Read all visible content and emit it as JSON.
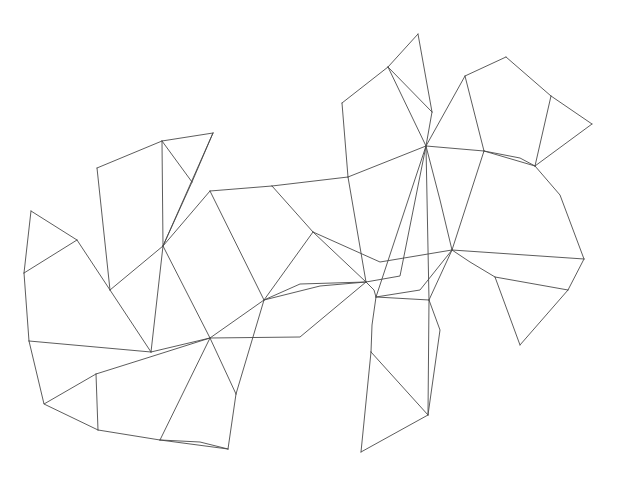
{
  "figure": {
    "background_color": "#ffffff",
    "stroke_color": "#4a4a4a",
    "stroke_width": 0.9,
    "canvas": {
      "width": 622,
      "height": 479
    },
    "cluster_labels": [
      "left-cluster",
      "right-cluster"
    ],
    "polygon_count": 22,
    "polygons": [
      {
        "id": "left-upper-quad",
        "name": "left upper quadrilateral",
        "sides": 4,
        "points": "97,168 162,141 163,246 110,290"
      },
      {
        "id": "left-top-triangle",
        "name": "left top triangle",
        "sides": 3,
        "points": "162,141 213,133 192,182"
      },
      {
        "id": "left-top-wedge",
        "name": "left top wedge triangle",
        "sides": 3,
        "points": "213,133 192,182 163,246"
      },
      {
        "id": "far-left-triangle",
        "name": "far left upper triangle",
        "sides": 3,
        "points": "31,211 77,240 24,273"
      },
      {
        "id": "far-left-quad",
        "name": "far left lower quadrilateral",
        "sides": 4,
        "points": "31,211 77,240 110,290 24,273"
      },
      {
        "id": "far-left-pent",
        "name": "far left pentagon",
        "sides": 5,
        "points": "24,273 110,290 163,286 151,352 29,341"
      },
      {
        "id": "left-mid-quad",
        "name": "left middle quadrilateral",
        "sides": 4,
        "points": "110,290 163,246 210,338 151,352"
      },
      {
        "id": "left-center-tri",
        "name": "left center triangle",
        "sides": 3,
        "points": "163,246 210,338 151,352"
      },
      {
        "id": "left-lower-pent",
        "name": "left lower pentagon",
        "sides": 5,
        "points": "29,341 151,352 210,338 216,340 160,440"
      },
      {
        "id": "bottom-left-tri",
        "name": "bottom left triangle",
        "sides": 3,
        "points": "44,404 96,374 98,430"
      },
      {
        "id": "bottom-left-quad",
        "name": "bottom left quadrilateral",
        "sides": 4,
        "points": "96,374 98,430 160,440 140,373"
      },
      {
        "id": "bottom-mid-quad",
        "name": "bottom middle quadrilateral",
        "sides": 4,
        "points": "210,338 236,394 228,449 160,440"
      },
      {
        "id": "bottom-mid-tri",
        "name": "bottom middle triangle",
        "sides": 3,
        "points": "210,338 264,300 236,394"
      },
      {
        "id": "center-quad",
        "name": "center quadrilateral",
        "sides": 4,
        "points": "163,246 210,191 264,300 210,338"
      },
      {
        "id": "center-lens-upper",
        "name": "center upper lens panel",
        "sides": 4,
        "points": "210,191 272,186 313,232 264,300"
      },
      {
        "id": "center-lens-lower",
        "name": "center lower lens panel",
        "sides": 4,
        "points": "264,300 313,232 366,282 280,281"
      },
      {
        "id": "center-right-quad",
        "name": "center right quadrilateral",
        "sides": 4,
        "points": "272,186 348,177 366,282 313,232"
      },
      {
        "id": "center-right-tri",
        "name": "center right triangle",
        "sides": 3,
        "points": "348,177 426,146 366,282"
      },
      {
        "id": "right-upper-quad",
        "name": "right upper quadrilateral",
        "sides": 4,
        "points": "342,103 388,67 426,146 348,177"
      },
      {
        "id": "right-top-tri",
        "name": "right top triangle",
        "sides": 3,
        "points": "388,67 418,34 432,112"
      },
      {
        "id": "right-top-wedge",
        "name": "right top wedge",
        "sides": 3,
        "points": "388,67 432,112 426,146"
      },
      {
        "id": "right-pent",
        "name": "right pentagon",
        "sides": 5,
        "points": "426,146 465,76 506,57 551,96 484,151"
      },
      {
        "id": "right-far-tri",
        "name": "right far triangle",
        "sides": 3,
        "points": "551,96 592,124 535,166"
      },
      {
        "id": "right-center-tri",
        "name": "right center triangle",
        "sides": 3,
        "points": "426,146 465,76 484,151"
      },
      {
        "id": "right-lower-pent",
        "name": "right lower pentagon",
        "sides": 5,
        "points": "484,151 535,166 592,124 584,259 452,250"
      },
      {
        "id": "right-lower-quad",
        "name": "right lower quadrilateral",
        "sides": 4,
        "points": "452,250 584,259 568,290 495,277"
      },
      {
        "id": "right-bottom-tri",
        "name": "right bottom triangle",
        "sides": 3,
        "points": "495,277 568,290 520,345"
      },
      {
        "id": "right-bottom-pent",
        "name": "right bottom pentagon",
        "sides": 5,
        "points": "426,146 484,151 452,250 429,300 376,297"
      },
      {
        "id": "bottom-right-quad",
        "name": "bottom right quadrilateral",
        "sides": 4,
        "points": "376,297 429,300 428,415 371,352"
      },
      {
        "id": "bottom-right-tri",
        "name": "bottom right triangle",
        "sides": 3,
        "points": "371,352 428,415 361,452"
      }
    ],
    "strokes": [
      {
        "id": "s01",
        "name": "left upper quad top edge",
        "d": "M 97,168 L 162,141"
      },
      {
        "id": "s02",
        "name": "left top triangle apex edge",
        "d": "M 162,141 L 213,133"
      },
      {
        "id": "s03",
        "name": "left top triangle right edge",
        "d": "M 213,133 L 192,182"
      },
      {
        "id": "s04",
        "name": "left top triangle base edge",
        "d": "M 192,182 L 162,141"
      },
      {
        "id": "s05",
        "name": "left top wedge long edge",
        "d": "M 213,133 L 163,246"
      },
      {
        "id": "s06",
        "name": "left top wedge inner edge",
        "d": "M 192,182 L 163,246"
      },
      {
        "id": "s07",
        "name": "left upper quad left edge",
        "d": "M 97,168 L 110,290"
      },
      {
        "id": "s08",
        "name": "left upper quad inner edge",
        "d": "M 162,141 L 163,246"
      },
      {
        "id": "s09",
        "name": "left upper quad bottom edge",
        "d": "M 110,290 L 163,246"
      },
      {
        "id": "s10",
        "name": "far left triangle top edge",
        "d": "M 31,211 L 77,240"
      },
      {
        "id": "s11",
        "name": "far left triangle left edge",
        "d": "M 31,211 L 24,273"
      },
      {
        "id": "s12",
        "name": "far left triangle base edge",
        "d": "M 77,240 L 24,273"
      },
      {
        "id": "s13",
        "name": "far left diagonal to hub",
        "d": "M 77,240 L 110,290"
      },
      {
        "id": "s14",
        "name": "far left pentagon left edge",
        "d": "M 24,273 L 29,341"
      },
      {
        "id": "s15",
        "name": "far left pentagon bottom edge",
        "d": "M 29,341 L 151,352"
      },
      {
        "id": "s16",
        "name": "far left pentagon inner edge",
        "d": "M 110,290 L 151,352"
      },
      {
        "id": "s17",
        "name": "left center hub to junction",
        "d": "M 163,246 L 210,338"
      },
      {
        "id": "s18",
        "name": "left center hub to lower vertex",
        "d": "M 163,246 L 151,352"
      },
      {
        "id": "s19",
        "name": "left lower pentagon top edge",
        "d": "M 151,352 L 210,338"
      },
      {
        "id": "s20",
        "name": "left lower pentagon right edge",
        "d": "M 210,338 L 160,440"
      },
      {
        "id": "s21",
        "name": "left lower pentagon bottom curve",
        "d": "M 29,341 L 44,404 L 96,374"
      },
      {
        "id": "s22",
        "name": "bottom left triangle left edge",
        "d": "M 44,404 L 98,430"
      },
      {
        "id": "s23",
        "name": "bottom left triangle inner edge",
        "d": "M 96,374 L 98,430"
      },
      {
        "id": "s24",
        "name": "bottom left quad bottom edge",
        "d": "M 98,430 L 160,440"
      },
      {
        "id": "s25",
        "name": "bottom left quad top curve",
        "d": "M 96,374 L 150,357 L 210,338"
      },
      {
        "id": "s26",
        "name": "bottom mid quad left edge",
        "d": "M 160,440 L 228,449"
      },
      {
        "id": "s27",
        "name": "bottom mid quad right edge",
        "d": "M 228,449 L 236,394"
      },
      {
        "id": "s28",
        "name": "bottom mid triangle right edge",
        "d": "M 236,394 L 264,300"
      },
      {
        "id": "s29",
        "name": "bottom mid triangle left edge",
        "d": "M 236,394 L 210,338"
      },
      {
        "id": "s30",
        "name": "center quad left edge",
        "d": "M 163,246 L 210,191"
      },
      {
        "id": "s31",
        "name": "center quad top edge",
        "d": "M 210,191 L 272,186"
      },
      {
        "id": "s32",
        "name": "center quad diagonal",
        "d": "M 210,191 L 264,300"
      },
      {
        "id": "s33",
        "name": "center hub to junction",
        "d": "M 264,300 L 210,338"
      },
      {
        "id": "s34",
        "name": "center lens upper right edge",
        "d": "M 272,186 L 313,232"
      },
      {
        "id": "s35",
        "name": "center lens mid edge",
        "d": "M 313,232 L 264,300"
      },
      {
        "id": "s36",
        "name": "center lens lower curve",
        "d": "M 264,300 L 320,286 L 366,282"
      },
      {
        "id": "s37",
        "name": "center lens diagonal",
        "d": "M 313,232 L 366,282"
      },
      {
        "id": "s38",
        "name": "center right quad top edge",
        "d": "M 272,186 L 348,177"
      },
      {
        "id": "s39",
        "name": "center right quad right edge",
        "d": "M 348,177 L 366,282"
      },
      {
        "id": "s40",
        "name": "center right triangle upper edge",
        "d": "M 348,177 L 426,146"
      },
      {
        "id": "s41",
        "name": "center right triangle lower curve",
        "d": "M 366,282 L 400,276 L 426,146"
      },
      {
        "id": "s42",
        "name": "right upper quad left edge",
        "d": "M 342,103 L 348,177"
      },
      {
        "id": "s43",
        "name": "right upper quad top edge",
        "d": "M 342,103 L 388,67"
      },
      {
        "id": "s44",
        "name": "right upper quad inner edge",
        "d": "M 388,67 L 426,146"
      },
      {
        "id": "s45",
        "name": "right top triangle left edge",
        "d": "M 388,67 L 418,34"
      },
      {
        "id": "s46",
        "name": "right top triangle right edge",
        "d": "M 418,34 L 432,112"
      },
      {
        "id": "s47",
        "name": "right top triangle base edge",
        "d": "M 432,112 L 388,67"
      },
      {
        "id": "s48",
        "name": "right top wedge edge",
        "d": "M 432,112 L 426,146"
      },
      {
        "id": "s49",
        "name": "right center triangle left edge",
        "d": "M 426,146 L 465,76"
      },
      {
        "id": "s50",
        "name": "right center triangle right edge",
        "d": "M 465,76 L 484,151"
      },
      {
        "id": "s51",
        "name": "right pentagon top edge",
        "d": "M 465,76 L 506,57"
      },
      {
        "id": "s52",
        "name": "right pentagon upper right edge",
        "d": "M 506,57 L 551,96"
      },
      {
        "id": "s53",
        "name": "right pentagon right edge",
        "d": "M 551,96 L 535,166"
      },
      {
        "id": "s54",
        "name": "right pentagon bottom edge",
        "d": "M 535,166 L 484,151"
      },
      {
        "id": "s55",
        "name": "right far triangle upper edge",
        "d": "M 551,96 L 592,124"
      },
      {
        "id": "s56",
        "name": "right far triangle lower edge",
        "d": "M 592,124 L 535,166"
      },
      {
        "id": "s57",
        "name": "right hub horizontal edge",
        "d": "M 426,146 L 484,151"
      },
      {
        "id": "s58",
        "name": "right lower pentagon curve",
        "d": "M 535,166 L 560,195 L 584,259"
      },
      {
        "id": "s59",
        "name": "right lower pentagon to hub",
        "d": "M 484,151 L 452,250"
      },
      {
        "id": "s60",
        "name": "right lower pentagon bottom edge",
        "d": "M 452,250 L 584,259"
      },
      {
        "id": "s61",
        "name": "right lower quad right edge",
        "d": "M 584,259 L 568,290"
      },
      {
        "id": "s62",
        "name": "right lower quad bottom edge",
        "d": "M 568,290 L 495,277"
      },
      {
        "id": "s63",
        "name": "right lower quad left curve",
        "d": "M 495,277 L 470,262 L 452,250"
      },
      {
        "id": "s64",
        "name": "right bottom triangle left edge",
        "d": "M 495,277 L 520,345"
      },
      {
        "id": "s65",
        "name": "right bottom triangle right edge",
        "d": "M 520,345 L 568,290"
      },
      {
        "id": "s66",
        "name": "right bottom pentagon diagonal",
        "d": "M 426,146 L 429,300"
      },
      {
        "id": "s67",
        "name": "right bottom pentagon left edge",
        "d": "M 426,146 L 376,297"
      },
      {
        "id": "s68",
        "name": "right hub to lower vertex",
        "d": "M 452,250 L 429,300"
      },
      {
        "id": "s69",
        "name": "right bottom junction edge",
        "d": "M 376,297 L 429,300"
      },
      {
        "id": "s70",
        "name": "bottom right quad left curve",
        "d": "M 376,297 L 372,325 L 371,352"
      },
      {
        "id": "s71",
        "name": "bottom right quad bottom edge",
        "d": "M 429,300 L 428,415"
      },
      {
        "id": "s72",
        "name": "bottom right triangle left edge",
        "d": "M 371,352 L 361,452"
      },
      {
        "id": "s73",
        "name": "bottom right triangle base edge",
        "d": "M 361,452 L 428,415"
      },
      {
        "id": "s74",
        "name": "bottom right triangle top edge",
        "d": "M 371,352 L 428,415"
      },
      {
        "id": "s75",
        "name": "center right long curve to left hub",
        "d": "M 366,282 L 300,284 L 264,300"
      },
      {
        "id": "s76",
        "name": "long sweeping arc from right hub to center",
        "d": "M 452,250 L 380,262 L 313,232"
      },
      {
        "id": "s77",
        "name": "long arc bottom of lens",
        "d": "M 210,338 L 300,337 L 366,282"
      },
      {
        "id": "s78",
        "name": "right pentagon lower left curve",
        "d": "M 484,151 L 520,158 L 535,166"
      },
      {
        "id": "s79",
        "name": "right arc to bottom pentagon",
        "d": "M 452,250 L 440,200 L 426,146"
      },
      {
        "id": "s80",
        "name": "arc from center to right bottom pentagon",
        "d": "M 366,282 L 374,290 L 376,297"
      },
      {
        "id": "s81",
        "name": "left outer arc of lower pentagon",
        "d": "M 160,440 L 200,442 L 228,449"
      },
      {
        "id": "s82",
        "name": "right cluster lower arc",
        "d": "M 429,300 L 440,330 L 428,415"
      },
      {
        "id": "s83",
        "name": "right cluster inner arc",
        "d": "M 376,297 L 420,290 L 452,250"
      }
    ]
  }
}
